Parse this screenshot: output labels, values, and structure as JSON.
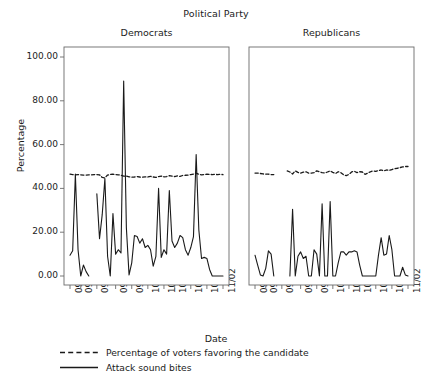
{
  "figure": {
    "title": "Political Party",
    "x_axis_label": "Date",
    "y_axis_label": "Percentage"
  },
  "panels": [
    {
      "name": "Democrats",
      "label": "Democrats"
    },
    {
      "name": "Republicans",
      "label": "Republicans"
    }
  ],
  "y_ticks": [
    "0.00",
    "20.00",
    "40.00",
    "60.00",
    "80.00",
    "100.00"
  ],
  "x_ticks": [
    "09/06",
    "09/10",
    "09/16",
    "09/23",
    "09/29",
    "10/05",
    "10/11",
    "10/15",
    "10/21",
    "10/27",
    "11/02"
  ],
  "legend": [
    {
      "key": "dashed-line",
      "label": "Percentage of voters favoring the candidate"
    },
    {
      "key": "solid-line",
      "label": "Attack sound bites"
    }
  ],
  "colors": {
    "line": "#1a1a1a",
    "frame": "#6a6a6a",
    "background": "#ffffff",
    "text": "#1c1c1c"
  },
  "chart_data": {
    "type": "line",
    "title": "Political Party",
    "xlabel": "Date",
    "ylabel": "Percentage",
    "ylim": [
      0,
      100
    ],
    "y_ticks": [
      0,
      20,
      40,
      60,
      80,
      100
    ],
    "grid": false,
    "legend_position": "bottom-left",
    "facets": [
      {
        "facet": "Democrats",
        "x_tick_labels": [
          "09/06",
          "09/10",
          "09/16",
          "09/23",
          "09/29",
          "10/05",
          "10/11",
          "10/15",
          "10/21",
          "10/27",
          "11/02"
        ],
        "x_tick_positions": [
          0,
          4,
          10,
          17,
          23,
          29,
          35,
          39,
          45,
          51,
          57
        ],
        "series": [
          {
            "name": "Attack sound bites",
            "style": "solid",
            "x": [
              0,
              1,
              2,
              3,
              4,
              5,
              6,
              7,
              8,
              9,
              10,
              11,
              12,
              13,
              14,
              15,
              16,
              17,
              18,
              19,
              20,
              21,
              22,
              23,
              24,
              25,
              26,
              27,
              28,
              29,
              30,
              31,
              32,
              33,
              34,
              35,
              36,
              37,
              38,
              39,
              40,
              41,
              42,
              43,
              44,
              45,
              46,
              47,
              48,
              49,
              50,
              51,
              52,
              53,
              54,
              55,
              56,
              57
            ],
            "values": [
              9.5,
              11.5,
              46.5,
              12.0,
              0.0,
              5.0,
              2.0,
              0.0,
              null,
              null,
              37.5,
              17.0,
              28.0,
              44.5,
              9.0,
              0.0,
              28.5,
              10.0,
              12.0,
              10.5,
              89.0,
              22.0,
              0.5,
              6.0,
              18.5,
              18.0,
              15.0,
              17.0,
              13.0,
              14.0,
              12.0,
              4.5,
              9.0,
              40.0,
              8.5,
              12.0,
              10.0,
              39.0,
              16.0,
              13.0,
              15.0,
              18.5,
              17.5,
              12.0,
              9.5,
              13.0,
              18.0,
              55.5,
              21.0,
              8.0,
              8.5,
              8.0,
              3.0,
              0.0,
              0.0,
              0.0,
              0.0,
              0.0
            ]
          },
          {
            "name": "Percentage of voters favoring the candidate",
            "style": "dashed",
            "x": [
              0,
              1,
              2,
              3,
              4,
              5,
              6,
              7,
              8,
              9,
              10,
              11,
              12,
              13,
              14,
              15,
              16,
              17,
              18,
              19,
              20,
              21,
              22,
              23,
              24,
              25,
              26,
              27,
              28,
              29,
              30,
              31,
              32,
              33,
              34,
              35,
              36,
              37,
              38,
              39,
              40,
              41,
              42,
              43,
              44,
              45,
              46,
              47,
              48,
              49,
              50,
              51,
              52,
              53,
              54,
              55,
              56,
              57
            ],
            "values": [
              46.5,
              46.3,
              46.2,
              46.3,
              46.2,
              46.1,
              46.1,
              46.2,
              46.2,
              46.3,
              46.3,
              46.2,
              45.0,
              44.8,
              46.1,
              46.4,
              46.5,
              46.3,
              46.2,
              46.0,
              45.6,
              45.6,
              45.3,
              45.1,
              45.2,
              45.4,
              45.2,
              45.1,
              45.3,
              45.2,
              45.5,
              45.2,
              45.0,
              45.4,
              45.6,
              45.3,
              45.4,
              45.8,
              45.6,
              45.4,
              45.7,
              45.5,
              45.9,
              46.0,
              46.1,
              46.3,
              46.5,
              47.0,
              46.4,
              46.2,
              46.3,
              46.5,
              46.4,
              46.3,
              46.4,
              46.3,
              46.4,
              46.3
            ]
          }
        ]
      },
      {
        "facet": "Republicans",
        "x_tick_labels": [
          "09/06",
          "09/10",
          "09/16",
          "09/23",
          "09/29",
          "10/05",
          "10/11",
          "10/15",
          "10/21",
          "10/27",
          "11/02"
        ],
        "x_tick_positions": [
          0,
          4,
          10,
          17,
          23,
          29,
          35,
          39,
          45,
          51,
          57
        ],
        "series": [
          {
            "name": "Attack sound bites",
            "style": "solid",
            "x": [
              0,
              1,
              2,
              3,
              4,
              5,
              6,
              7,
              8,
              9,
              10,
              11,
              12,
              13,
              14,
              15,
              16,
              17,
              18,
              19,
              20,
              21,
              22,
              23,
              24,
              25,
              26,
              27,
              28,
              29,
              30,
              31,
              32,
              33,
              34,
              35,
              36,
              37,
              38,
              39,
              40,
              41,
              42,
              43,
              44,
              45,
              46,
              47,
              48,
              49,
              50,
              51,
              52,
              53,
              54,
              55,
              56,
              57
            ],
            "values": [
              9.5,
              5.0,
              0.5,
              0.0,
              3.5,
              11.5,
              10.0,
              0.0,
              null,
              null,
              null,
              null,
              null,
              0.0,
              30.5,
              0.0,
              9.0,
              11.0,
              8.0,
              9.0,
              0.0,
              0.0,
              12.0,
              10.0,
              0.0,
              33.0,
              0.0,
              0.0,
              34.0,
              0.0,
              0.0,
              6.0,
              11.0,
              11.0,
              9.5,
              11.0,
              11.0,
              11.5,
              11.0,
              5.0,
              0.0,
              0.0,
              0.0,
              0.0,
              0.0,
              0.0,
              9.5,
              17.5,
              9.5,
              10.0,
              18.5,
              12.0,
              0.0,
              0.0,
              0.0,
              4.0,
              0.5,
              0.0
            ]
          },
          {
            "name": "Percentage of voters favoring the candidate",
            "style": "dashed",
            "x": [
              0,
              1,
              2,
              3,
              4,
              5,
              6,
              7,
              8,
              9,
              10,
              11,
              12,
              13,
              14,
              15,
              16,
              17,
              18,
              19,
              20,
              21,
              22,
              23,
              24,
              25,
              26,
              27,
              28,
              29,
              30,
              31,
              32,
              33,
              34,
              35,
              36,
              37,
              38,
              39,
              40,
              41,
              42,
              43,
              44,
              45,
              46,
              47,
              48,
              49,
              50,
              51,
              52,
              53,
              54,
              55,
              56,
              57
            ],
            "values": [
              47.0,
              47.0,
              46.8,
              46.6,
              46.5,
              46.5,
              46.3,
              46.3,
              null,
              null,
              null,
              null,
              48.0,
              47.5,
              46.6,
              48.0,
              47.3,
              47.0,
              47.4,
              47.6,
              47.0,
              47.0,
              47.2,
              48.0,
              47.6,
              47.2,
              47.0,
              47.5,
              48.0,
              47.3,
              46.8,
              47.6,
              47.2,
              46.2,
              45.8,
              46.4,
              47.5,
              47.8,
              47.2,
              47.6,
              47.5,
              46.4,
              47.0,
              47.6,
              48.0,
              47.8,
              48.2,
              48.4,
              48.0,
              48.4,
              48.2,
              48.6,
              49.0,
              49.2,
              49.5,
              49.8,
              50.0,
              50.0
            ]
          }
        ]
      }
    ]
  }
}
